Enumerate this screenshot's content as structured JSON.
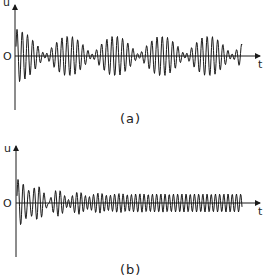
{
  "panels": [
    {
      "id": "a",
      "caption": "(a)",
      "y_label": "u",
      "x_label": "t",
      "origin_label": "O",
      "description": "Irregular (beating) oscillation of roughly constant amplitude about zero"
    },
    {
      "id": "b",
      "caption": "(b)",
      "y_label": "u",
      "x_label": "t",
      "origin_label": "O",
      "description": "Transient oscillation that settles into a steady periodic oscillation of constant amplitude"
    }
  ],
  "colors": {
    "line": "#1a1a1a",
    "background": "#ffffff"
  }
}
